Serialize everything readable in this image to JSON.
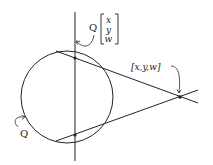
{
  "diagram": {
    "labels": {
      "conic": "Q",
      "polar_prefix": "Q",
      "vector_components": [
        "x",
        "y",
        "w"
      ],
      "point": "[x,y,w]"
    },
    "colors": {
      "stroke": "#222222",
      "background": "#ffffff"
    },
    "geometry": {
      "circle": {
        "cx": 67,
        "cy": 97,
        "r": 46
      },
      "polar_line": {
        "x1": 75,
        "y1": 12,
        "x2": 75,
        "y2": 161
      },
      "tangent_upper": {
        "x1": 56,
        "y1": 51,
        "x2": 198,
        "y2": 103
      },
      "tangent_lower": {
        "x1": 56,
        "y1": 141,
        "x2": 198,
        "y2": 90
      },
      "tangent_points": [
        {
          "x": 75,
          "y": 58
        },
        {
          "x": 75,
          "y": 135
        }
      ],
      "external_point": {
        "x": 180,
        "y": 97
      }
    }
  }
}
